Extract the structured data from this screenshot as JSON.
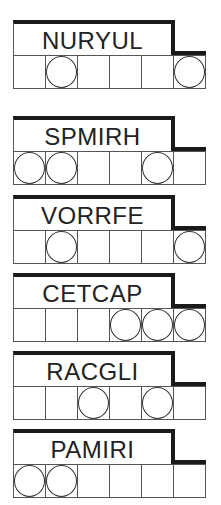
{
  "puzzles": [
    {
      "word": "NURYUL",
      "circles": [
        false,
        true,
        false,
        false,
        false,
        true
      ],
      "top": 20
    },
    {
      "word": "SPMIRH",
      "circles": [
        true,
        true,
        false,
        false,
        true,
        false
      ],
      "top": 116
    },
    {
      "word": "VORRFE",
      "circles": [
        false,
        true,
        false,
        false,
        false,
        true
      ],
      "top": 195
    },
    {
      "word": "CETCAP",
      "circles": [
        false,
        false,
        false,
        true,
        true,
        true
      ],
      "top": 273
    },
    {
      "word": "RACGLI",
      "circles": [
        false,
        false,
        true,
        false,
        true,
        false
      ],
      "top": 351
    },
    {
      "word": "PAMIRI",
      "circles": [
        true,
        true,
        false,
        false,
        false,
        false
      ],
      "top": 429
    }
  ],
  "colors": {
    "border": "#1a1a1a",
    "grid": "#555555",
    "text": "#222222",
    "background": "#ffffff"
  }
}
